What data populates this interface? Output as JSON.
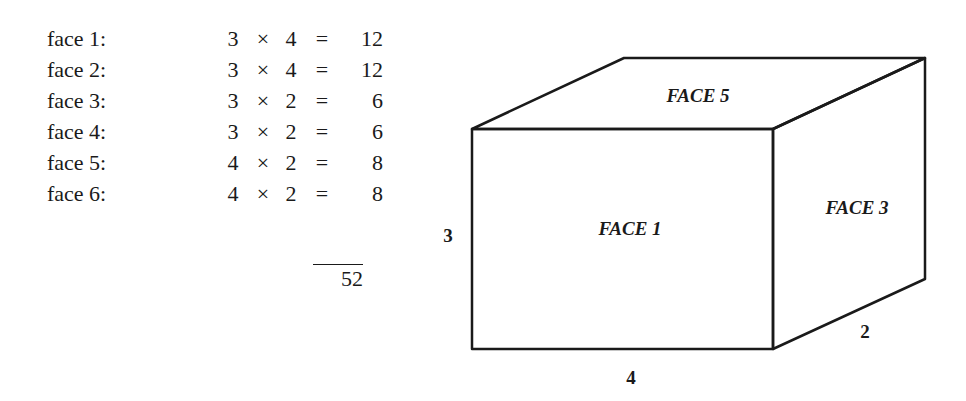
{
  "calculation": {
    "rows": [
      {
        "label": "face 1:",
        "a": "3",
        "op": "×",
        "b": "4",
        "eq": "=",
        "result": "12"
      },
      {
        "label": "face 2:",
        "a": "3",
        "op": "×",
        "b": "4",
        "eq": "=",
        "result": "12"
      },
      {
        "label": "face 3:",
        "a": "3",
        "op": "×",
        "b": "2",
        "eq": "=",
        "result": "6"
      },
      {
        "label": "face 4:",
        "a": "3",
        "op": "×",
        "b": "2",
        "eq": "=",
        "result": "6"
      },
      {
        "label": "face 5:",
        "a": "4",
        "op": "×",
        "b": "2",
        "eq": "=",
        "result": "8"
      },
      {
        "label": "face 6:",
        "a": "4",
        "op": "×",
        "b": "2",
        "eq": "=",
        "result": "8"
      }
    ],
    "total": "52"
  },
  "diagram": {
    "face_labels": {
      "front": "FACE 1",
      "top": "FACE 5",
      "side": "FACE 3"
    },
    "dimensions": {
      "height": "3",
      "length": "4",
      "depth": "2"
    }
  }
}
